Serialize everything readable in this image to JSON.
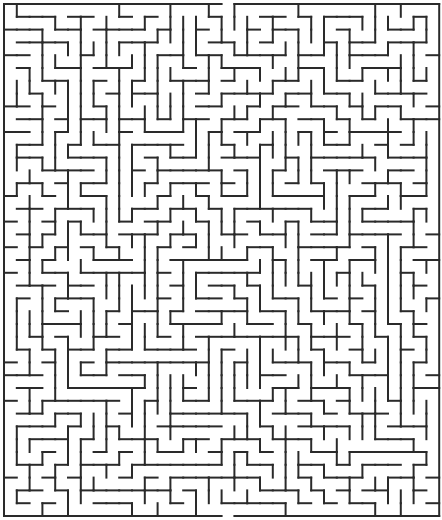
{
  "maze": {
    "title": "Rectangular maze",
    "cols": 34,
    "rows": 40,
    "origin": [
      4,
      4
    ],
    "cell": 12.8,
    "wall_color": "#2a2a2a",
    "background": "#ffffff",
    "entrance": {
      "side": "top",
      "col": 17
    },
    "exit": {
      "side": "bottom",
      "col": 17
    },
    "walls_h": [
      [
        0,
        1,
        1,
        3
      ],
      [
        1,
        3,
        0,
        4
      ],
      [
        1,
        4,
        1,
        3
      ],
      [
        2,
        3,
        1,
        2
      ],
      [
        3,
        1,
        1,
        1
      ],
      [
        2,
        5,
        0,
        1
      ],
      [
        3,
        0,
        4,
        6
      ],
      [
        5,
        1,
        2,
        3
      ],
      [
        6,
        0,
        1,
        1
      ],
      [
        7,
        0,
        1,
        2
      ],
      [
        6,
        4,
        0,
        2
      ],
      [
        7,
        5,
        2,
        3
      ],
      [
        8,
        1,
        1,
        3
      ],
      [
        9,
        0,
        3,
        5
      ],
      [
        10,
        1,
        2,
        5
      ],
      [
        11,
        0,
        2,
        3
      ],
      [
        12,
        2,
        1,
        1
      ],
      [
        13,
        1,
        1,
        2
      ],
      [
        14,
        1,
        1,
        3
      ],
      [
        15,
        0,
        2,
        3
      ],
      [
        16,
        2,
        1,
        1
      ],
      [
        17,
        1,
        1,
        3
      ],
      [
        18,
        0,
        3,
        4
      ],
      [
        19,
        1,
        2,
        3
      ],
      [
        20,
        0,
        2,
        3
      ],
      [
        21,
        1,
        3,
        4
      ],
      [
        22,
        1,
        1,
        3
      ],
      [
        23,
        0,
        2,
        2
      ],
      [
        24,
        1,
        1,
        4
      ],
      [
        25,
        0,
        1,
        3
      ],
      [
        26,
        1,
        4,
        5
      ],
      [
        27,
        0,
        1,
        2
      ],
      [
        28,
        2,
        1,
        3
      ],
      [
        29,
        1,
        1,
        3
      ],
      [
        30,
        0,
        3,
        4
      ],
      [
        31,
        1,
        1,
        3
      ],
      [
        32,
        0,
        2,
        3
      ],
      [
        33,
        1,
        1,
        2
      ],
      [
        34,
        0,
        2,
        4
      ],
      [
        35,
        1,
        1,
        3
      ],
      [
        36,
        0,
        1,
        2
      ],
      [
        37,
        1,
        1,
        3
      ],
      [
        38,
        0,
        2,
        3
      ],
      [
        39,
        1,
        1,
        2
      ]
    ],
    "walls_v": [
      [
        1,
        1,
        2,
        3
      ],
      [
        3,
        0,
        2,
        2
      ],
      [
        5,
        2,
        1,
        3
      ],
      [
        8,
        1,
        3,
        4
      ],
      [
        10,
        0,
        2,
        3
      ],
      [
        12,
        2,
        1,
        5
      ],
      [
        14,
        1,
        2,
        4
      ],
      [
        16,
        0,
        1,
        3
      ],
      [
        18,
        2,
        3,
        4
      ],
      [
        20,
        1,
        1,
        3
      ],
      [
        22,
        0,
        2,
        4
      ],
      [
        24,
        2,
        1,
        3
      ],
      [
        26,
        1,
        2,
        3
      ],
      [
        28,
        0,
        3,
        4
      ],
      [
        30,
        2,
        1,
        3
      ],
      [
        32,
        1,
        2,
        4
      ],
      [
        6,
        12,
        2,
        5
      ],
      [
        9,
        15,
        3,
        4
      ],
      [
        11,
        20,
        2,
        3
      ],
      [
        13,
        25,
        3,
        4
      ],
      [
        15,
        28,
        2,
        3
      ],
      [
        17,
        30,
        1,
        4
      ],
      [
        19,
        33,
        2,
        3
      ],
      [
        21,
        35,
        1,
        3
      ],
      [
        23,
        36,
        2,
        3
      ],
      [
        25,
        10,
        3,
        4
      ],
      [
        27,
        14,
        2,
        3
      ],
      [
        29,
        18,
        1,
        3
      ],
      [
        31,
        22,
        2,
        4
      ],
      [
        33,
        26,
        1,
        3
      ]
    ]
  },
  "chart_data": null
}
